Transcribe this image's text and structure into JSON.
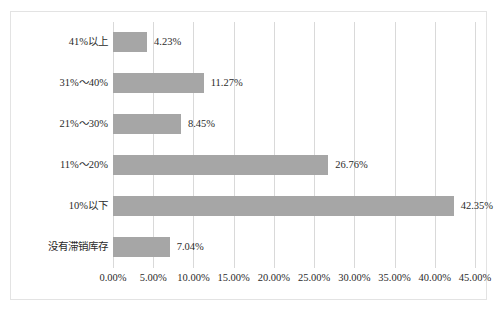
{
  "chart_data": {
    "type": "bar",
    "orientation": "horizontal",
    "title": "",
    "xlabel": "",
    "ylabel": "",
    "categories": [
      "41%以上",
      "31%～40%",
      "21%～30%",
      "11%～20%",
      "10%以下",
      "没有滞销库存"
    ],
    "values": [
      4.23,
      11.27,
      8.45,
      26.76,
      42.35,
      7.04
    ],
    "value_labels": [
      "4.23%",
      "11.27%",
      "8.45%",
      "26.76%",
      "42.35%",
      "7.04%"
    ],
    "xlim": [
      0,
      45
    ],
    "xtick_values": [
      0,
      5,
      10,
      15,
      20,
      25,
      30,
      35,
      40,
      45
    ],
    "xtick_labels": [
      "0.00%",
      "5.00%",
      "10.00%",
      "15.00%",
      "20.00%",
      "25.00%",
      "30.00%",
      "35.00%",
      "40.00%",
      "45.00%"
    ],
    "grid": "vertical",
    "legend": "none",
    "bar_color": "#a6a6a6",
    "gridline_color": "#d9d9d9",
    "frame_color": "#e3e3e3",
    "text_color": "#2b2b2b"
  }
}
